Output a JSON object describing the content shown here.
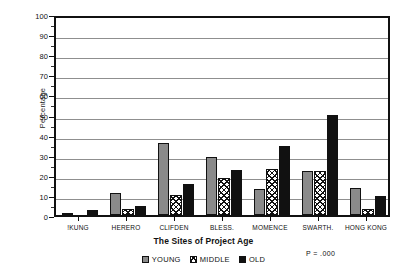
{
  "chart_data": {
    "type": "bar",
    "title": "",
    "xlabel": "The Sites of Project Age",
    "ylabel": "Percentage",
    "ylim": [
      0,
      100
    ],
    "ytick_step": 10,
    "yticks": [
      0,
      10,
      20,
      30,
      40,
      50,
      60,
      70,
      80,
      90,
      100
    ],
    "ytick_labels": [
      "0",
      "10",
      "20",
      "30",
      "40",
      "50",
      "60",
      "70",
      "80",
      "90",
      "100"
    ],
    "minor_tick_step": 5,
    "grid": "horizontal",
    "legend_position": "bottom-center",
    "categories": [
      "!KUNG",
      "HERERO",
      "CLIFDEN",
      "BLESS.",
      "MOMENCE",
      "SWARTH.",
      "HONG KONG"
    ],
    "series": [
      {
        "name": "YOUNG",
        "fill": "solid-gray",
        "color": "#8a8a8a",
        "values": [
          1,
          11,
          36,
          29,
          13,
          22,
          13.5
        ]
      },
      {
        "name": "MIDDLE",
        "fill": "crosshatch",
        "color": "#ffffff",
        "values": [
          0,
          3,
          10,
          18.5,
          23,
          22,
          3
        ]
      },
      {
        "name": "OLD",
        "fill": "solid-black",
        "color": "#111111",
        "values": [
          2.5,
          4.5,
          15.5,
          22.5,
          34.5,
          50,
          9.5
        ]
      }
    ],
    "annotations": [
      {
        "name": "p-value",
        "text": "P = .000"
      }
    ]
  },
  "legend": {
    "items": [
      {
        "label": "YOUNG",
        "swatch": "solid-gray"
      },
      {
        "label": "MIDDLE",
        "swatch": "crosshatch"
      },
      {
        "label": "OLD",
        "swatch": "solid-black"
      }
    ]
  }
}
